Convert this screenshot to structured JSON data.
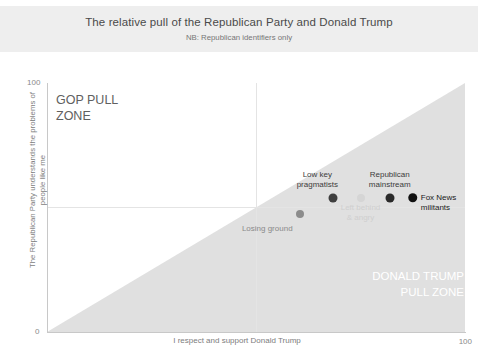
{
  "header": {
    "title": "The relative pull of the Republican Party and Donald Trump",
    "subtitle": "NB: Republican identifiers only"
  },
  "zones": {
    "gop": "GOP PULL\nZONE",
    "trump": "DONALD TRUMP\nPULL ZONE"
  },
  "axes": {
    "x_title": "I respect and support Donald Trump",
    "y_title": "The Republican Party understands\nthe problems of people like me",
    "x_min_label": "0",
    "x_max_label": "100",
    "y_min_label": "0",
    "y_max_label": "100"
  },
  "colors": {
    "banner": "#eeeeee",
    "zone_fill": "#e0e0e0",
    "gridline": "#e4e4e4",
    "axis": "#c8c8c8",
    "dot_dark": "#1a1a1a",
    "dot_mid": "#3f3f3f",
    "dot_gray": "#8c8c8c",
    "dot_light": "#d5d5d5",
    "label_dark": "#3c3c3c",
    "label_gray": "#8a8a8a",
    "label_faint": "#cfcfcf",
    "zone_text_light": "#ffffff",
    "zone_text_dark": "#606060"
  },
  "chart_data": {
    "type": "scatter",
    "title": "The relative pull of the Republican Party and Donald Trump",
    "subtitle": "NB: Republican identifiers only",
    "xlabel": "I respect and support Donald Trump",
    "ylabel": "The Republican Party understands the problems of people like me",
    "xlim": [
      0,
      100
    ],
    "ylim": [
      0,
      100
    ],
    "grid": true,
    "gridlines_x": [
      50
    ],
    "gridlines_y": [
      50
    ],
    "legend": "none",
    "annotations": [
      {
        "text": "GOP PULL ZONE",
        "region": "upper-left"
      },
      {
        "text": "DONALD TRUMP PULL ZONE",
        "region": "lower-right"
      }
    ],
    "shaded_region": {
      "label": "DONALD TRUMP PULL ZONE",
      "description": "Triangle below the y=x diagonal, from origin to top-right corner",
      "color": "#e0e0e0"
    },
    "points": [
      {
        "label": "Losing ground",
        "x": 60.5,
        "y": 47.5,
        "color": "#8c8c8c",
        "size": 8,
        "label_color": "#8a8a8a",
        "label_position": "below-left"
      },
      {
        "label": "Low key\npragmatists",
        "x": 68.5,
        "y": 54,
        "color": "#3f3f3f",
        "size": 9,
        "label_color": "#3c3c3c",
        "label_position": "above-left"
      },
      {
        "label": "Left behind\n& angry",
        "x": 75,
        "y": 54,
        "color": "#d5d5d5",
        "size": 8,
        "label_color": "#cfcfcf",
        "label_position": "below"
      },
      {
        "label": "Republican\nmainstream",
        "x": 82,
        "y": 54,
        "color": "#2a2a2a",
        "size": 9,
        "label_color": "#3c3c3c",
        "label_position": "above"
      },
      {
        "label": "Fox News militants",
        "x": 87.5,
        "y": 54,
        "color": "#111111",
        "size": 9.5,
        "label_color": "#1a1a1a",
        "label_position": "right"
      }
    ]
  }
}
